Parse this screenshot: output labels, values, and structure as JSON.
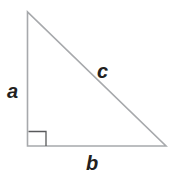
{
  "diagram": {
    "type": "right-triangle",
    "labels": {
      "a": "a",
      "b": "b",
      "c": "c"
    },
    "colors": {
      "line": "#a7a9ac",
      "rightAngle": "#58595b",
      "text": "#231f20"
    }
  }
}
